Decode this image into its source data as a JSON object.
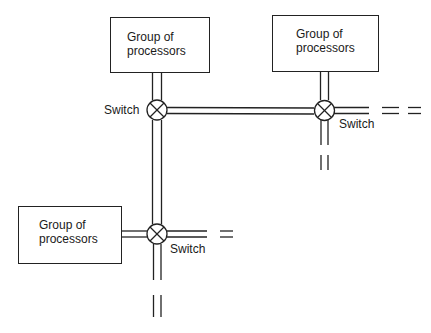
{
  "diagram": {
    "type": "interconnection-network",
    "colors": {
      "line": "#222222",
      "background": "#ffffff",
      "text": "#1a1a1a"
    },
    "processor_groups": [
      {
        "id": "group-top-left",
        "label_line1": "Group of",
        "label_line2": "processors"
      },
      {
        "id": "group-top-right",
        "label_line1": "Group of",
        "label_line2": "processors"
      },
      {
        "id": "group-bottom-left",
        "label_line1": "Group of",
        "label_line2": "processors"
      }
    ],
    "switches": [
      {
        "id": "switch-top-left",
        "label": "Switch"
      },
      {
        "id": "switch-top-right",
        "label": "Switch"
      },
      {
        "id": "switch-bottom",
        "label": "Switch"
      }
    ],
    "connections": [
      {
        "from": "group-top-left",
        "to": "switch-top-left"
      },
      {
        "from": "switch-top-left",
        "to": "switch-top-right"
      },
      {
        "from": "group-top-right",
        "to": "switch-top-right"
      },
      {
        "from": "switch-top-left",
        "to": "switch-bottom"
      },
      {
        "from": "group-bottom-left",
        "to": "switch-bottom"
      },
      {
        "from": "switch-top-right",
        "to": "continues-right"
      },
      {
        "from": "switch-top-right",
        "to": "continues-down"
      },
      {
        "from": "switch-bottom",
        "to": "continues-right"
      },
      {
        "from": "switch-bottom",
        "to": "continues-down"
      }
    ]
  }
}
